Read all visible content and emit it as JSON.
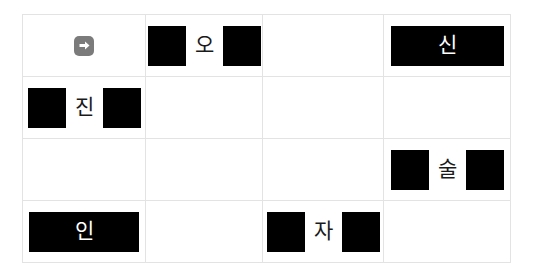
{
  "worksheet": {
    "type": "korean-syllable-grid",
    "columns": 4,
    "rows": 4,
    "border_color": "#e3e3e3",
    "background_color": "#ffffff",
    "blank_color": "#000000",
    "icon_color": "#7b7b7b",
    "cells": [
      {
        "row": 1,
        "col": 1,
        "kind": "icon",
        "icon": "arrow-right-rounded-icon",
        "text": ""
      },
      {
        "row": 1,
        "col": 2,
        "kind": "syllable-between-blanks",
        "text": "오"
      },
      {
        "row": 1,
        "col": 3,
        "kind": "empty",
        "text": ""
      },
      {
        "row": 1,
        "col": 4,
        "kind": "syllable-on-bar",
        "text": "신"
      },
      {
        "row": 2,
        "col": 1,
        "kind": "syllable-between-blanks",
        "text": "진"
      },
      {
        "row": 2,
        "col": 2,
        "kind": "empty",
        "text": ""
      },
      {
        "row": 2,
        "col": 3,
        "kind": "empty",
        "text": ""
      },
      {
        "row": 2,
        "col": 4,
        "kind": "empty",
        "text": ""
      },
      {
        "row": 3,
        "col": 1,
        "kind": "empty",
        "text": ""
      },
      {
        "row": 3,
        "col": 2,
        "kind": "empty",
        "text": ""
      },
      {
        "row": 3,
        "col": 3,
        "kind": "empty",
        "text": ""
      },
      {
        "row": 3,
        "col": 4,
        "kind": "syllable-between-blanks",
        "text": "술"
      },
      {
        "row": 4,
        "col": 1,
        "kind": "syllable-on-bar",
        "text": "인"
      },
      {
        "row": 4,
        "col": 2,
        "kind": "empty",
        "text": ""
      },
      {
        "row": 4,
        "col": 3,
        "kind": "syllable-between-blanks",
        "text": "자"
      },
      {
        "row": 4,
        "col": 4,
        "kind": "empty",
        "text": ""
      }
    ]
  }
}
